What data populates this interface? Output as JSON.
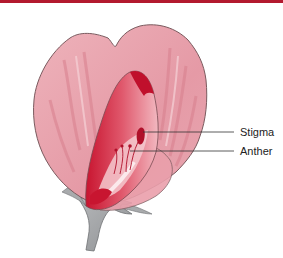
{
  "figure": {
    "labels": [
      {
        "id": "stigma",
        "text": "Stigma"
      },
      {
        "id": "anther",
        "text": "Anther"
      }
    ],
    "colors": {
      "top_bar": "#b3192f",
      "petal": "#e9a3ad",
      "petal_outline": "#7a5a5e",
      "keel": "#d93a54",
      "keel_dark": "#c0102c",
      "stem": "#9ea0a2",
      "leader_line": "#333333"
    }
  }
}
